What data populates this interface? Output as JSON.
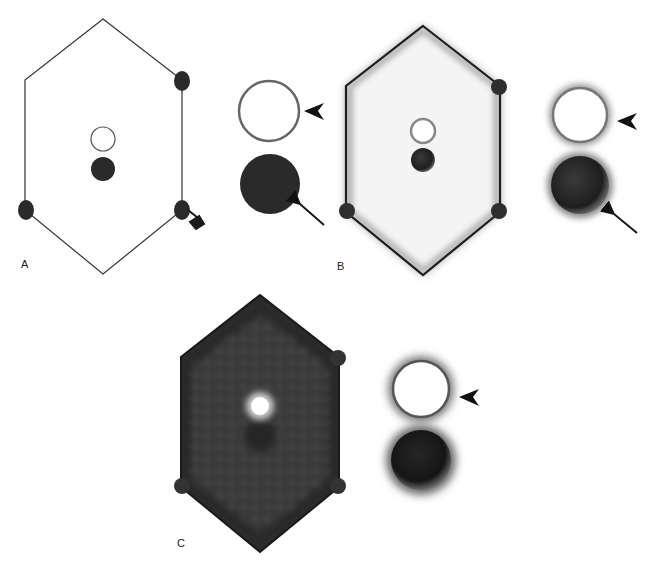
{
  "figure": {
    "panels": [
      {
        "id": "A",
        "label": "A",
        "style": "line drawing",
        "annotations": [
          "arrowhead",
          "arrow",
          "bold-arrow"
        ]
      },
      {
        "id": "B",
        "label": "B",
        "style": "shaded, light fill",
        "annotations": [
          "arrowhead",
          "arrow"
        ]
      },
      {
        "id": "C",
        "label": "C",
        "style": "shaded, dark textured fill",
        "annotations": [
          "arrowhead"
        ]
      }
    ],
    "colors": {
      "background": "#ffffff",
      "outline": "#222222",
      "dark_fill": "#2a2a2a",
      "ring_outline": "#666666",
      "panel_c_fill": "#3a3a3a"
    }
  }
}
